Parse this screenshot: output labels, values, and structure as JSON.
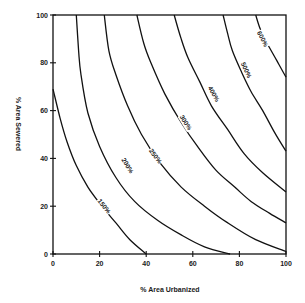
{
  "chart_data": {
    "type": "line",
    "subtype": "contour",
    "title": "",
    "xlabel": "% Area Urbanized",
    "ylabel": "% Area Sewered",
    "xlim": [
      0,
      100
    ],
    "ylim": [
      0,
      100
    ],
    "xticks": [
      0,
      20,
      40,
      60,
      80,
      100
    ],
    "yticks": [
      0,
      20,
      40,
      60,
      80,
      100
    ],
    "grid": false,
    "legend": null,
    "series": [
      {
        "name": "150%",
        "label_at": [
          22,
          20
        ],
        "points": [
          [
            0,
            69
          ],
          [
            3,
            57
          ],
          [
            6,
            47
          ],
          [
            10,
            37
          ],
          [
            15,
            28
          ],
          [
            21,
            20
          ],
          [
            27,
            13
          ],
          [
            33,
            6
          ],
          [
            40,
            0
          ]
        ]
      },
      {
        "name": "200%",
        "label_at": [
          32,
          37
        ],
        "points": [
          [
            10,
            100
          ],
          [
            11,
            85
          ],
          [
            12,
            75
          ],
          [
            15,
            59
          ],
          [
            20,
            45
          ],
          [
            27,
            32
          ],
          [
            35,
            22
          ],
          [
            45,
            14
          ],
          [
            55,
            8
          ],
          [
            65,
            3
          ],
          [
            76,
            0
          ]
        ]
      },
      {
        "name": "250%",
        "label_at": [
          44,
          41
        ],
        "points": [
          [
            22,
            100
          ],
          [
            24,
            85
          ],
          [
            27,
            75
          ],
          [
            32,
            62
          ],
          [
            38,
            50
          ],
          [
            46,
            38
          ],
          [
            55,
            28
          ],
          [
            65,
            20
          ],
          [
            75,
            13
          ],
          [
            87,
            6
          ],
          [
            100,
            1
          ]
        ]
      },
      {
        "name": "300%",
        "label_at": [
          57,
          55
        ],
        "points": [
          [
            36,
            100
          ],
          [
            39,
            88
          ],
          [
            42,
            80
          ],
          [
            48,
            67
          ],
          [
            55,
            55
          ],
          [
            62,
            45
          ],
          [
            70,
            35
          ],
          [
            78,
            28
          ],
          [
            85,
            22
          ],
          [
            93,
            17
          ],
          [
            100,
            13
          ]
        ]
      },
      {
        "name": "400%",
        "label_at": [
          69,
          67
        ],
        "points": [
          [
            52,
            100
          ],
          [
            55,
            90
          ],
          [
            58,
            82
          ],
          [
            63,
            72
          ],
          [
            68,
            62
          ],
          [
            75,
            52
          ],
          [
            82,
            42
          ],
          [
            90,
            34
          ],
          [
            100,
            26
          ]
        ]
      },
      {
        "name": "500%",
        "label_at": [
          83,
          77
        ],
        "points": [
          [
            73,
            100
          ],
          [
            75,
            92
          ],
          [
            77,
            85
          ],
          [
            81,
            76
          ],
          [
            85,
            68
          ],
          [
            90,
            60
          ],
          [
            95,
            51
          ],
          [
            100,
            43
          ]
        ]
      },
      {
        "name": "600%",
        "label_at": [
          90,
          90
        ],
        "points": [
          [
            87,
            100
          ],
          [
            89,
            94
          ],
          [
            92,
            88
          ],
          [
            96,
            81
          ],
          [
            100,
            74
          ]
        ]
      }
    ]
  },
  "axes": {
    "x_title": "% Area Urbanized",
    "y_title": "% Area Sewered",
    "x_tick_labels": [
      "0",
      "20",
      "40",
      "60",
      "80",
      "100"
    ],
    "y_tick_labels": [
      "0",
      "20",
      "40",
      "60",
      "80",
      "100"
    ]
  }
}
